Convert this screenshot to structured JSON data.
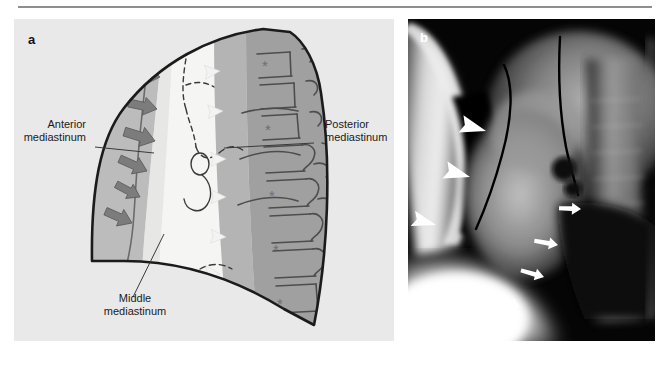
{
  "figure": {
    "panels": [
      {
        "letter": "a",
        "type": "line-diagram",
        "description": "Schematic lateral chest diagram showing the three mediastinal compartments",
        "labels": [
          {
            "id": "anterior",
            "text_line1": "Anterior",
            "text_line2": "mediastinum"
          },
          {
            "id": "middle",
            "text_line1": "Middle",
            "text_line2": "mediastinum"
          },
          {
            "id": "posterior",
            "text_line1": "Posterior",
            "text_line2": "mediastinum"
          }
        ],
        "markers": {
          "solid_arrows": 6,
          "open_arrowheads": 6,
          "asterisks": 5
        },
        "colors": {
          "background": "#e9e9e9",
          "anterior_fill": "#b9b9b9",
          "middle_fill": "#f4f4f4",
          "posterior_fill": "#a8a8a8",
          "vertebral_fill": "#9a9a9a",
          "outline": "#1b1b1b",
          "solid_arrow": "#7a7a7a",
          "open_arrowhead": "#f2f2f2"
        }
      },
      {
        "letter": "b",
        "type": "radiograph",
        "description": "Lateral chest radiograph of the same region",
        "markers": {
          "arrowheads": 3,
          "arrows": 4
        },
        "colors": {
          "background": "#000000",
          "marker": "#ffffff"
        }
      }
    ]
  }
}
